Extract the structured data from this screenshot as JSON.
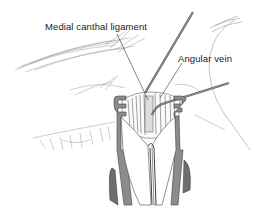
{
  "figure": {
    "labels": [
      {
        "id": "medial-canthal-ligament",
        "text": "Medial canthal ligament"
      },
      {
        "id": "angular-vein",
        "text": "Angular vein"
      }
    ],
    "colors": {
      "line": "#333333",
      "instrument_fill": "#8c8c8c",
      "instrument_dark": "#5a5a5a",
      "hair": "#9a9a9a",
      "background": "#ffffff"
    }
  }
}
